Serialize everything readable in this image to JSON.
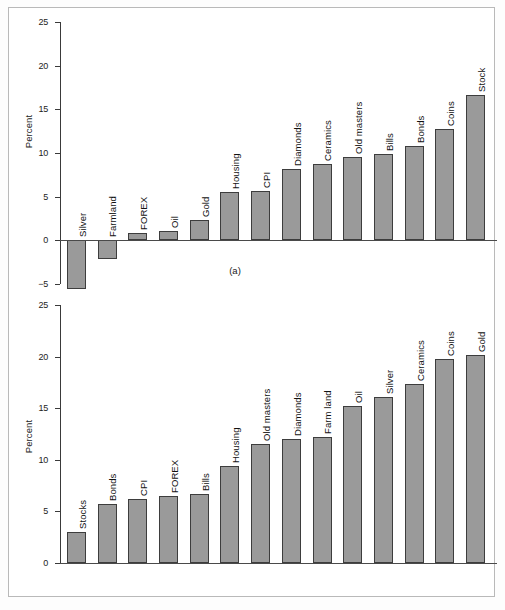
{
  "figure": {
    "background": "#ffffff",
    "bar_fill": "#9a9a9a",
    "bar_stroke": "#3d3d3d",
    "axis_color": "#3a3a3a"
  },
  "panel_a": {
    "caption": "(a)",
    "ylabel": "Percent",
    "ticks": [
      "25",
      "20",
      "15",
      "10",
      "5",
      "0",
      "-5"
    ]
  },
  "panel_b": {
    "caption": "(b)",
    "ylabel": "Percent",
    "ticks": [
      "25",
      "20",
      "15",
      "10",
      "5",
      "0"
    ]
  },
  "chart_data": [
    {
      "type": "bar",
      "id": "a",
      "title": "(a)",
      "xlabel": "",
      "ylabel": "Percent",
      "ylim": [
        -5,
        25
      ],
      "yticks": [
        -5,
        0,
        5,
        10,
        15,
        20,
        25
      ],
      "grid": false,
      "legend": "none",
      "orientation": "vertical",
      "categories": [
        "Silver",
        "Farmland",
        "FOREX",
        "Oil",
        "Gold",
        "Housing",
        "CPI",
        "Diamonds",
        "Ceramics",
        "Old masters",
        "Bills",
        "Bonds",
        "Coins",
        "Stock"
      ],
      "values": [
        -5.6,
        -2.1,
        0.8,
        1.1,
        2.3,
        5.5,
        5.7,
        8.2,
        8.7,
        9.5,
        9.9,
        10.8,
        12.7,
        16.6
      ]
    },
    {
      "type": "bar",
      "id": "b",
      "title": "(b)",
      "xlabel": "",
      "ylabel": "Percent",
      "ylim": [
        0,
        25
      ],
      "yticks": [
        0,
        5,
        10,
        15,
        20,
        25
      ],
      "grid": false,
      "legend": "none",
      "orientation": "vertical",
      "categories": [
        "Stocks",
        "Bonds",
        "CPI",
        "FOREX",
        "Bills",
        "Housing",
        "Old masters",
        "Diamonds",
        "Farm land",
        "Oil",
        "Silver",
        "Ceramics",
        "Coins",
        "Gold"
      ],
      "values": [
        3.0,
        5.7,
        6.2,
        6.5,
        6.7,
        9.4,
        11.5,
        12.0,
        12.2,
        15.2,
        16.1,
        17.3,
        19.8,
        20.2
      ]
    }
  ]
}
